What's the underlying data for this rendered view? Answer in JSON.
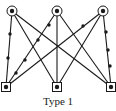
{
  "caption": "Type 1",
  "colors": {
    "stroke": "#1a1a1a",
    "background": "#ffffff"
  },
  "graph": {
    "top_nodes": [
      {
        "id": "t1",
        "x": 12,
        "y": 11,
        "shape": "circle"
      },
      {
        "id": "t2",
        "x": 57,
        "y": 11,
        "shape": "circle"
      },
      {
        "id": "t3",
        "x": 103,
        "y": 11,
        "shape": "circle"
      }
    ],
    "bottom_nodes": [
      {
        "id": "b1",
        "x": 6,
        "y": 87,
        "shape": "square"
      },
      {
        "id": "b2",
        "x": 57,
        "y": 87,
        "shape": "square"
      },
      {
        "id": "b3",
        "x": 111,
        "y": 87,
        "shape": "square"
      }
    ],
    "edges": [
      {
        "from": "t1",
        "to": "b1",
        "dots": [
          [
            10,
            34
          ],
          [
            8,
            58
          ]
        ]
      },
      {
        "from": "t1",
        "to": "b2",
        "dots": []
      },
      {
        "from": "t1",
        "to": "b3",
        "dots": []
      },
      {
        "from": "t2",
        "to": "b1",
        "dots": [
          [
            49,
            25
          ],
          [
            38,
            40
          ],
          [
            25,
            60
          ],
          [
            16,
            73
          ]
        ]
      },
      {
        "from": "t2",
        "to": "b2",
        "dots": []
      },
      {
        "from": "t2",
        "to": "b3",
        "dots": []
      },
      {
        "from": "t3",
        "to": "b1",
        "dots": [
          [
            83,
            26
          ]
        ]
      },
      {
        "from": "t3",
        "to": "b2",
        "dots": []
      },
      {
        "from": "t3",
        "to": "b3",
        "dots": [
          [
            106,
            32
          ],
          [
            108,
            50
          ],
          [
            110,
            66
          ]
        ]
      }
    ]
  }
}
